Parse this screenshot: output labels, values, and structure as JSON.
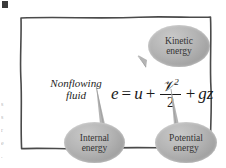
{
  "figure": {
    "name": "nonflowing-fluid-energy-diagram",
    "panel_label": "Nonflowing fluid",
    "equation": {
      "lhs": "e",
      "equals": "=",
      "term_internal": "u",
      "plus_1": "+",
      "fraction_numerator": "ᵤ2",
      "fraction_numerator_base": "𝒱",
      "fraction_numerator_exponent": "2",
      "fraction_denominator": "2",
      "plus_2": "+",
      "term_potential": "gz",
      "full_text": "e = u + V²/2 + gz"
    },
    "callouts": [
      {
        "id": "kinetic",
        "line1": "Kinetic",
        "line2": "energy",
        "points_to": "V²/2"
      },
      {
        "id": "internal",
        "line1": "Internal",
        "line2": "energy",
        "points_to": "u"
      },
      {
        "id": "potential",
        "line1": "Potential",
        "line2": "energy",
        "points_to": "gz"
      }
    ],
    "edge_text": [
      "s",
      "s",
      "r",
      "e",
      "."
    ],
    "colors": {
      "background": "#ffffff",
      "frame_line": "#4a4a4a",
      "bubble_fill": "#b4b4b4",
      "bubble_text": "#343434",
      "equation_text": "#1a1a1a",
      "label_text": "#1d1d1d"
    }
  }
}
